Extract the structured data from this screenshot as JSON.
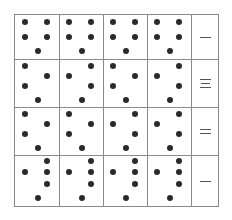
{
  "puzzle": {
    "grid": {
      "columns": 5,
      "rows": 4,
      "line_color": "#8a8a8a",
      "dot_color": "#2a2a2a"
    },
    "rows": [
      {
        "label": "一",
        "label_strokes": 1,
        "cells": [
          {
            "dots": [
              [
                10,
                7
              ],
              [
                32,
                7
              ],
              [
                10,
                22
              ],
              [
                32,
                22
              ],
              [
                23,
                36
              ]
            ]
          },
          {
            "dots": [
              [
                10,
                7
              ],
              [
                32,
                7
              ],
              [
                10,
                22
              ],
              [
                32,
                22
              ],
              [
                23,
                36
              ]
            ]
          },
          {
            "dots": [
              [
                10,
                7
              ],
              [
                32,
                7
              ],
              [
                10,
                22
              ],
              [
                32,
                22
              ],
              [
                23,
                36
              ]
            ]
          },
          {
            "dots": [
              [
                10,
                7
              ],
              [
                32,
                7
              ],
              [
                10,
                22
              ],
              [
                32,
                22
              ],
              [
                23,
                36
              ]
            ]
          }
        ]
      },
      {
        "label": "三",
        "label_strokes": 3,
        "cells": [
          {
            "dots": [
              [
                10,
                6
              ],
              [
                32,
                16
              ],
              [
                10,
                26
              ],
              [
                23,
                40
              ]
            ]
          },
          {
            "dots": [
              [
                32,
                6
              ],
              [
                10,
                16
              ],
              [
                32,
                26
              ],
              [
                23,
                40
              ]
            ]
          },
          {
            "dots": [
              [
                10,
                6
              ],
              [
                32,
                16
              ],
              [
                10,
                26
              ],
              [
                23,
                40
              ]
            ]
          },
          {
            "dots": [
              [
                32,
                6
              ],
              [
                10,
                16
              ],
              [
                32,
                26
              ],
              [
                23,
                40
              ]
            ]
          }
        ]
      },
      {
        "label": "二",
        "label_strokes": 2,
        "cells": [
          {
            "dots": [
              [
                10,
                6
              ],
              [
                32,
                16
              ],
              [
                10,
                26
              ],
              [
                23,
                40
              ]
            ]
          },
          {
            "dots": [
              [
                10,
                6
              ],
              [
                32,
                16
              ],
              [
                10,
                26
              ],
              [
                23,
                40
              ]
            ]
          },
          {
            "dots": [
              [
                32,
                6
              ],
              [
                10,
                16
              ],
              [
                32,
                26
              ],
              [
                23,
                40
              ]
            ]
          },
          {
            "dots": [
              [
                32,
                6
              ],
              [
                10,
                16
              ],
              [
                32,
                26
              ],
              [
                23,
                40
              ]
            ]
          }
        ]
      },
      {
        "label": "一",
        "label_strokes": 1,
        "cells": [
          {
            "dots": [
              [
                32,
                5
              ],
              [
                10,
                16
              ],
              [
                32,
                16
              ],
              [
                32,
                28
              ],
              [
                23,
                42
              ]
            ]
          },
          {
            "dots": [
              [
                32,
                5
              ],
              [
                10,
                16
              ],
              [
                32,
                16
              ],
              [
                32,
                28
              ],
              [
                23,
                42
              ]
            ]
          },
          {
            "dots": [
              [
                32,
                5
              ],
              [
                10,
                16
              ],
              [
                32,
                16
              ],
              [
                32,
                28
              ],
              [
                23,
                42
              ]
            ]
          },
          {
            "dots": [
              [
                32,
                5
              ],
              [
                10,
                16
              ],
              [
                32,
                16
              ],
              [
                32,
                28
              ],
              [
                23,
                42
              ]
            ]
          }
        ]
      }
    ]
  }
}
